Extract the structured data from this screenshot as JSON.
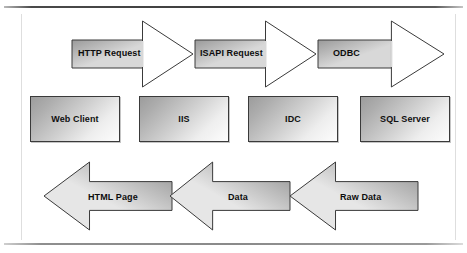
{
  "figure": {
    "background_color": "#ffffff",
    "rule_color": "#3d3d3d",
    "frame_color": "#dedede"
  },
  "nodes": [
    {
      "id": "web-client",
      "label": "Web Client",
      "x": 30,
      "y": 96,
      "w": 90,
      "h": 46
    },
    {
      "id": "iis",
      "label": "IIS",
      "x": 139,
      "y": 96,
      "w": 90,
      "h": 46
    },
    {
      "id": "idc",
      "label": "IDC",
      "x": 248,
      "y": 96,
      "w": 90,
      "h": 46
    },
    {
      "id": "sql-server",
      "label": "SQL Server",
      "x": 360,
      "y": 96,
      "w": 90,
      "h": 46
    }
  ],
  "arrows_forward": [
    {
      "id": "http-request",
      "label": "HTTP Request",
      "direction": "right",
      "style": "open-head",
      "x": 70,
      "y": 19,
      "w": 125,
      "h": 70,
      "shaft_fill_from": "#9a9a9a",
      "shaft_fill_to": "#d8d8d8",
      "head_fill": "#ffffff",
      "stroke": "#3a3a3a",
      "label_x": 78,
      "label_y": 48
    },
    {
      "id": "isapi-request",
      "label": "ISAPI Request",
      "direction": "right",
      "style": "open-head",
      "x": 193,
      "y": 19,
      "w": 125,
      "h": 70,
      "shaft_fill_from": "#9a9a9a",
      "shaft_fill_to": "#d8d8d8",
      "head_fill": "#ffffff",
      "stroke": "#3a3a3a",
      "label_x": 200,
      "label_y": 48
    },
    {
      "id": "odbc",
      "label": "ODBC",
      "direction": "right",
      "style": "open-head",
      "x": 316,
      "y": 19,
      "w": 130,
      "h": 70,
      "shaft_fill_from": "#9a9a9a",
      "shaft_fill_to": "#d8d8d8",
      "head_fill": "#ffffff",
      "stroke": "#3a3a3a",
      "label_x": 333,
      "label_y": 48
    }
  ],
  "arrows_return": [
    {
      "id": "html-page",
      "label": "HTML Page",
      "direction": "left",
      "style": "solid",
      "x": 42,
      "y": 160,
      "w": 132,
      "h": 72,
      "fill_from": "#8f8f8f",
      "fill_to": "#e6e6e6",
      "stroke": "#3a3a3a",
      "label_x": 88,
      "label_y": 192
    },
    {
      "id": "data",
      "label": "Data",
      "direction": "left",
      "style": "solid",
      "x": 168,
      "y": 160,
      "w": 124,
      "h": 72,
      "fill_from": "#8f8f8f",
      "fill_to": "#e6e6e6",
      "stroke": "#3a3a3a",
      "label_x": 228,
      "label_y": 192
    },
    {
      "id": "raw-data",
      "label": "Raw Data",
      "direction": "left",
      "style": "solid",
      "x": 288,
      "y": 160,
      "w": 132,
      "h": 72,
      "fill_from": "#8f8f8f",
      "fill_to": "#e6e6e6",
      "stroke": "#3a3a3a",
      "label_x": 340,
      "label_y": 192
    }
  ]
}
